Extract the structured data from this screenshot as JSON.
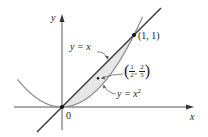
{
  "figure": {
    "axes": {
      "x_label": "x",
      "y_label": "y",
      "origin_label": "0"
    },
    "curves": [
      {
        "name": "line",
        "label_lhs": "y = ",
        "label_rhs": "x",
        "equation": "y = x"
      },
      {
        "name": "parabola",
        "label_lhs": "y = ",
        "label_base": "x",
        "label_exp": "2",
        "equation": "y = x^2"
      }
    ],
    "points": {
      "intersection": {
        "label": "(1, 1)",
        "x": 1,
        "y": 1
      },
      "centroid": {
        "num_x": "1",
        "den_x": "2",
        "num_y": "2",
        "den_y": "5",
        "x": 0.5,
        "y": 0.4
      }
    },
    "shaded_region": "between y = x and y = x^2 for 0 ≤ x ≤ 1",
    "colors": {
      "stroke_line": "#3a3a3a",
      "stroke_parabola": "#8a8a8a",
      "fill_region": "#e6e6e6",
      "axis": "#555555",
      "text": "#222222"
    }
  }
}
